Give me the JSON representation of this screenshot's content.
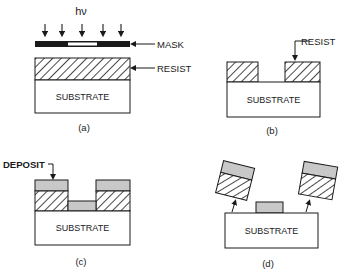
{
  "colors": {
    "ink": "#1a1a1a",
    "deposit": "#c8c8c8",
    "background": "#ffffff"
  },
  "panels": [
    {
      "id": "a",
      "caption": "(a)",
      "radiation_label": "hν",
      "labels": {
        "mask": "MASK",
        "resist": "RESIST",
        "substrate": "SUBSTRATE"
      }
    },
    {
      "id": "b",
      "caption": "(b)",
      "labels": {
        "resist": "RESIST",
        "substrate": "SUBSTRATE"
      }
    },
    {
      "id": "c",
      "caption": "(c)",
      "labels": {
        "deposit": "DEPOSIT",
        "substrate": "SUBSTRATE"
      }
    },
    {
      "id": "d",
      "caption": "(d)",
      "labels": {
        "substrate": "SUBSTRATE"
      }
    }
  ]
}
